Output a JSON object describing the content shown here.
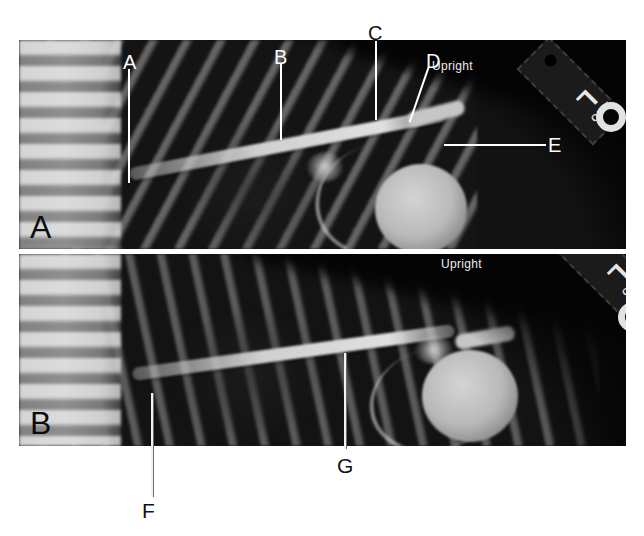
{
  "figure": {
    "panels": [
      {
        "panel_letter": "A",
        "orientation_label": "Upright",
        "marker": {
          "side_letter": "L",
          "tag_text": "AAO"
        },
        "annotations": [
          {
            "label": "A"
          },
          {
            "label": "B"
          },
          {
            "label": "C"
          },
          {
            "label": "D"
          },
          {
            "label": "E"
          }
        ]
      },
      {
        "panel_letter": "B",
        "orientation_label": "Upright",
        "marker": {
          "side_letter": "L",
          "tag_text": "AAO"
        },
        "annotations": [
          {
            "label": "F"
          },
          {
            "label": "G"
          }
        ]
      }
    ],
    "colors": {
      "page_background": "#ffffff",
      "film_black": "#0a0a0a",
      "annotation_white": "#ffffff",
      "annotation_black": "#111111"
    }
  }
}
